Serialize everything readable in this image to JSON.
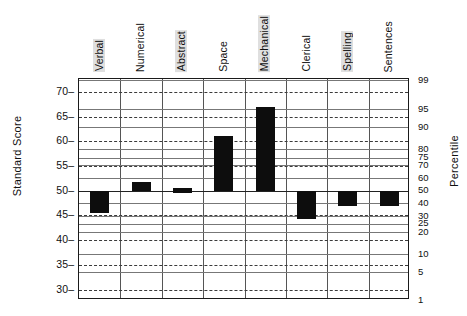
{
  "chart_data": {
    "type": "bar",
    "title": "",
    "subtitle": "",
    "xlabel": "",
    "ylabel": "Standard Score",
    "ylabel_right": "Percentile",
    "categories": [
      "Verbal",
      "Numerical",
      "Abstract",
      "Space",
      "Mechanical",
      "Clerical",
      "Spelling",
      "Sentences"
    ],
    "orientation": "vertical",
    "baseline": 50,
    "ylim": [
      28,
      73
    ],
    "grid": true,
    "legend": "none",
    "value_kind": "range-band",
    "note": "Each bar is a confidence band drawn from the 50 baseline to the score value.",
    "values": [
      45.5,
      51.7,
      50.0,
      61.0,
      67.0,
      44.3,
      47.0,
      47.0
    ],
    "bands": [
      {
        "category": "Verbal",
        "low": 45.5,
        "high": 50.0
      },
      {
        "category": "Numerical",
        "low": 50.0,
        "high": 51.7
      },
      {
        "category": "Abstract",
        "low": 49.5,
        "high": 50.5
      },
      {
        "category": "Space",
        "low": 50.0,
        "high": 61.0
      },
      {
        "category": "Mechanical",
        "low": 50.0,
        "high": 67.0
      },
      {
        "category": "Clerical",
        "low": 44.3,
        "high": 50.0
      },
      {
        "category": "Spelling",
        "low": 47.0,
        "high": 50.0
      },
      {
        "category": "Sentences",
        "low": 47.0,
        "high": 50.0
      }
    ],
    "left_axis": {
      "label": "Standard Score",
      "ticks": [
        70,
        65,
        60,
        55,
        50,
        45,
        40,
        35,
        30
      ]
    },
    "right_axis": {
      "label": "Percentile",
      "ticks": [
        99,
        95,
        90,
        80,
        75,
        70,
        60,
        50,
        40,
        30,
        25,
        20,
        10,
        5,
        1
      ],
      "tick_scores": [
        72.3,
        66.5,
        62.8,
        58.4,
        56.7,
        55.2,
        52.5,
        50.0,
        47.5,
        44.8,
        43.3,
        41.6,
        37.2,
        33.5,
        27.7
      ]
    },
    "series": [
      {
        "name": "Aptitude score band",
        "color": "#0d0d0d",
        "values": [
          45.5,
          51.7,
          50.0,
          61.0,
          67.0,
          44.3,
          47.0,
          47.0
        ]
      }
    ]
  },
  "colors": {
    "bar": "#0d0d0d",
    "frame": "#1a1a1a",
    "grid_dashed": "#3b3b3b",
    "grid_solid": "#777777",
    "vertical_grid": "#555555",
    "background": "#ffffff",
    "text": "#101010",
    "label_highlight": "#969696"
  },
  "left_ticks": [
    {
      "value": "70"
    },
    {
      "value": "65"
    },
    {
      "value": "60"
    },
    {
      "value": "55"
    },
    {
      "value": "50"
    },
    {
      "value": "45"
    },
    {
      "value": "40"
    },
    {
      "value": "35"
    },
    {
      "value": "30"
    }
  ],
  "right_ticks": [
    {
      "value": "99"
    },
    {
      "value": "95"
    },
    {
      "value": "90"
    },
    {
      "value": "80"
    },
    {
      "value": "75"
    },
    {
      "value": "70"
    },
    {
      "value": "60"
    },
    {
      "value": "50"
    },
    {
      "value": "40"
    },
    {
      "value": "30"
    },
    {
      "value": "25"
    },
    {
      "value": "20"
    },
    {
      "value": "10"
    },
    {
      "value": "5"
    },
    {
      "value": "1"
    }
  ],
  "category_labels": [
    {
      "text": "Verbal",
      "highlighted": true
    },
    {
      "text": "Numerical",
      "highlighted": false
    },
    {
      "text": "Abstract",
      "highlighted": true
    },
    {
      "text": "Space",
      "highlighted": false
    },
    {
      "text": "Mechanical",
      "highlighted": true
    },
    {
      "text": "Clerical",
      "highlighted": false
    },
    {
      "text": "Spelling",
      "highlighted": true
    },
    {
      "text": "Sentences",
      "highlighted": false
    }
  ],
  "axis_titles": {
    "left": "Standard Score",
    "right": "Percentile"
  }
}
